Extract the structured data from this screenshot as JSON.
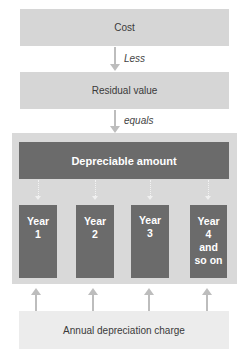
{
  "boxes": {
    "cost": "Cost",
    "residual": "Residual value",
    "depreciable": "Depreciable amount",
    "annual_charge": "Annual depreciation charge"
  },
  "connectors": {
    "less": "Less",
    "equals": "equals"
  },
  "years": [
    {
      "line1": "Year",
      "line2": "1",
      "line3": "",
      "line4": ""
    },
    {
      "line1": "Year",
      "line2": "2",
      "line3": "",
      "line4": ""
    },
    {
      "line1": "Year",
      "line2": "3",
      "line3": "",
      "line4": ""
    },
    {
      "line1": "Year",
      "line2": "4",
      "line3": "and",
      "line4": "so on"
    }
  ],
  "colors": {
    "light_box": "#d6d6d6",
    "dark_box": "#6b6b6b",
    "outer_panel": "#d9d9d9",
    "bottom_box": "#ececec",
    "arrow": "#bdbdbd"
  }
}
